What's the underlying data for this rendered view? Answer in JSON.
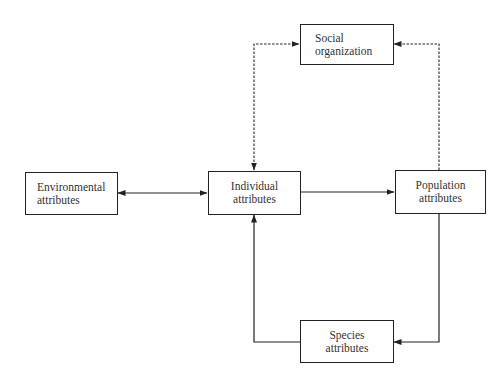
{
  "diagram": {
    "nodes": {
      "social": {
        "line1": "Social",
        "line2": "organization"
      },
      "environmental": {
        "line1": "Environmental",
        "line2": "attributes"
      },
      "individual": {
        "line1": "Individual",
        "line2": "attributes"
      },
      "population": {
        "line1": "Population",
        "line2": "attributes"
      },
      "species": {
        "line1": "Species",
        "line2": "attributes"
      }
    },
    "edges": [
      {
        "from": "environmental",
        "to": "individual",
        "style": "solid",
        "direction": "both"
      },
      {
        "from": "individual",
        "to": "population",
        "style": "solid",
        "direction": "forward"
      },
      {
        "from": "population",
        "to": "species",
        "style": "solid",
        "direction": "forward"
      },
      {
        "from": "species",
        "to": "individual",
        "style": "solid",
        "direction": "forward"
      },
      {
        "from": "individual",
        "to": "social",
        "style": "dashed",
        "direction": "both"
      },
      {
        "from": "population",
        "to": "social",
        "style": "dashed",
        "direction": "forward"
      }
    ],
    "colors": {
      "line": "#222222",
      "text": "#333333",
      "background": "#ffffff"
    }
  }
}
